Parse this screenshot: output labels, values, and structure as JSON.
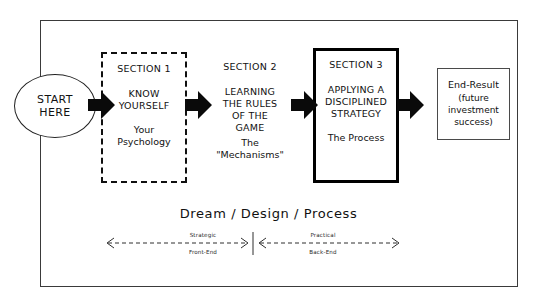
{
  "diagram": {
    "title_annotation": "Dream / Design  / Process",
    "start_node": {
      "line1": "START",
      "line2": "HERE",
      "shape": "ellipse"
    },
    "sections": [
      {
        "id": "section-1",
        "label": "SECTION 1",
        "heading_line1": "KNOW",
        "heading_line2": "YOURSELF",
        "sub_line1": "Your",
        "sub_line2": "Psychology",
        "border_style": "dashed-short"
      },
      {
        "id": "section-2",
        "label": "SECTION 2",
        "heading_line1": "LEARNING",
        "heading_line2": "THE RULES",
        "heading_line3": "OF THE",
        "heading_line4": "GAME",
        "sub_line1": "The",
        "sub_line2": "\"Mechanisms\"",
        "border_style": "dashed-long"
      },
      {
        "id": "section-3",
        "label": "SECTION 3",
        "heading_line1": "APPLYING A",
        "heading_line2": "DISCIPLINED",
        "heading_line3": "STRATEGY",
        "sub_line1": "The Process",
        "border_style": "solid-thick"
      }
    ],
    "end_result": {
      "title": "End-Result",
      "line1": "(future",
      "line2": "investment",
      "line3": "success)"
    },
    "measures": [
      {
        "id": "strategic",
        "top_label": "Strategic",
        "bottom_label": "Front-End",
        "arrow_type": "double-headed-dashed"
      },
      {
        "id": "practical",
        "top_label": "Practical",
        "bottom_label": "Back-End",
        "arrow_type": "double-headed-dashed"
      }
    ],
    "colors": {
      "ink": "#111111",
      "frame": "#3a3a3a",
      "arrow_fill": "#0a0a0a",
      "background": "#ffffff"
    }
  }
}
